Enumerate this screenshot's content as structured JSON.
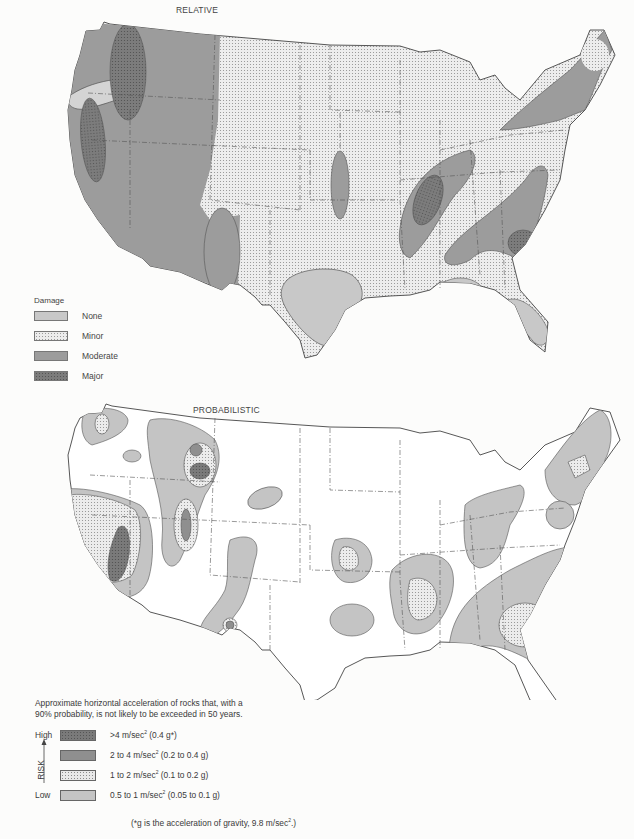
{
  "figure": {
    "maps": [
      {
        "id": "relative",
        "title": "RELATIVE",
        "legend": {
          "header": "Damage",
          "items": [
            {
              "label": "None",
              "fill": "#c8c8c8",
              "pattern": "solid"
            },
            {
              "label": "Minor",
              "fill": "#ececec",
              "pattern": "stipple"
            },
            {
              "label": "Moderate",
              "fill": "#9c9c9c",
              "pattern": "solid"
            },
            {
              "label": "Major",
              "fill": "#7c7c7c",
              "pattern": "stipple"
            }
          ]
        }
      },
      {
        "id": "probabilistic",
        "title": "PROBABILISTIC",
        "legend": {
          "description": "Approximate horizontal acceleration of rocks that, with a 90% probability, is not likely to be exceeded in 50 years.",
          "axis_label": "RISK",
          "axis_high": "High",
          "axis_low": "Low",
          "items": [
            {
              "label_main": ">4 m/sec",
              "label_sup": "2",
              "label_tail": " (0.4 g*)",
              "fill": "#7a7a7a",
              "pattern": "stipple"
            },
            {
              "label_main": "2 to 4 m/sec",
              "label_sup": "2",
              "label_tail": " (0.2 to 0.4 g)",
              "fill": "#8f8f8f",
              "pattern": "solid"
            },
            {
              "label_main": "1 to 2 m/sec",
              "label_sup": "2",
              "label_tail": " (0.1 to 0.2 g)",
              "fill": "#e8e8e8",
              "pattern": "stipple"
            },
            {
              "label_main": "0.5 to 1 m/sec",
              "label_sup": "2",
              "label_tail": " (0.05 to 0.1 g)",
              "fill": "#c4c4c4",
              "pattern": "solid"
            }
          ],
          "footnote_main": "(*g is the acceleration of gravity, 9.8 m/sec",
          "footnote_sup": "2",
          "footnote_tail": ".)"
        }
      }
    ]
  }
}
